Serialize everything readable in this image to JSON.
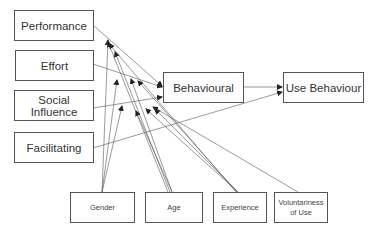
{
  "diagram": {
    "constructs": [
      {
        "id": "performance",
        "label": "Performance"
      },
      {
        "id": "effort",
        "label": "Effort"
      },
      {
        "id": "social",
        "label": "Social Influence"
      },
      {
        "id": "facilitating",
        "label": "Facilitating"
      }
    ],
    "behavioural": {
      "label": "Behavioural"
    },
    "use_behaviour": {
      "label": "Use Behaviour"
    },
    "moderators": [
      {
        "id": "gender",
        "label": "Gender"
      },
      {
        "id": "age",
        "label": "Age"
      },
      {
        "id": "experience",
        "label": "Experience"
      },
      {
        "id": "voluntariness",
        "label": "Voluntariness of Use"
      }
    ],
    "edges": [
      {
        "from": "Performance",
        "to": "Behavioural"
      },
      {
        "from": "Effort",
        "to": "Behavioural"
      },
      {
        "from": "Social Influence",
        "to": "Behavioural"
      },
      {
        "from": "Behavioural",
        "to": "Use Behaviour"
      },
      {
        "from": "Facilitating",
        "to": "Use Behaviour"
      },
      {
        "from": "Gender",
        "to": "Performance→Behavioural"
      },
      {
        "from": "Gender",
        "to": "Effort→Behavioural"
      },
      {
        "from": "Gender",
        "to": "Social Influence→Behavioural"
      },
      {
        "from": "Age",
        "to": "Performance→Behavioural"
      },
      {
        "from": "Age",
        "to": "Effort→Behavioural"
      },
      {
        "from": "Age",
        "to": "Social Influence→Behavioural"
      },
      {
        "from": "Age",
        "to": "Facilitating→Use Behaviour"
      },
      {
        "from": "Experience",
        "to": "Effort→Behavioural"
      },
      {
        "from": "Experience",
        "to": "Social Influence→Behavioural"
      },
      {
        "from": "Experience",
        "to": "Facilitating→Use Behaviour"
      },
      {
        "from": "Voluntariness of Use",
        "to": "Social Influence→Behavioural"
      }
    ]
  }
}
